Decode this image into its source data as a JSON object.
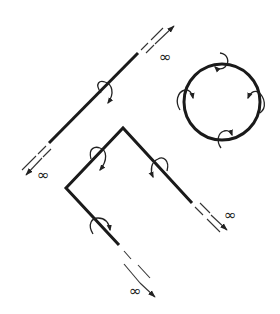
{
  "figure": {
    "colors": {
      "wire": "#1a1a1a",
      "background": "#ffffff"
    },
    "labels": {
      "infinity_straight_upper": "∞",
      "infinity_straight_lower": "∞",
      "infinity_bent_right": "∞",
      "infinity_bent_bottom": "∞"
    },
    "elements": [
      {
        "id": "straight-wire",
        "type": "infinite straight conductor",
        "field_loops": 1,
        "ends": [
          "upper-right to ∞",
          "lower-left to ∞"
        ]
      },
      {
        "id": "bent-wire",
        "type": "bent conductor with two legs to ∞",
        "field_loops": 3,
        "ends": [
          "right to ∞",
          "bottom to ∞"
        ]
      },
      {
        "id": "circular-loop",
        "type": "closed circular conductor",
        "field_loops": 4
      }
    ]
  }
}
